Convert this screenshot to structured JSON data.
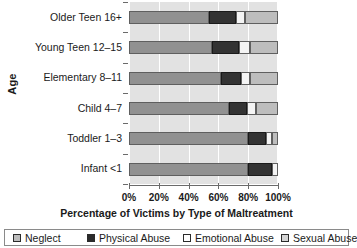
{
  "chart_data": {
    "type": "bar",
    "orientation": "horizontal",
    "stacked": true,
    "normalized": "100%",
    "title": "",
    "xlabel": "Percentage of Victims by Type of Maltreatment",
    "ylabel": "Age",
    "xlim": [
      0,
      100
    ],
    "xticks": [
      "0%",
      "20%",
      "40%",
      "60%",
      "80%",
      "100%"
    ],
    "xtick_values": [
      0,
      20,
      40,
      60,
      80,
      100
    ],
    "grid": "vertical",
    "legend_position": "bottom",
    "categories": [
      "Infant <1",
      "Toddler 1–3",
      "Child 4–7",
      "Elementary 8–11",
      "Young Teen 12–15",
      "Older Teen 16+"
    ],
    "categories_top_to_bottom": [
      "Older Teen 16+",
      "Young Teen 12–15",
      "Elementary 8–11",
      "Child 4–7",
      "Toddler 1–3",
      "Infant <1"
    ],
    "series": [
      {
        "name": "Neglect",
        "color": "#919191",
        "values": [
          80,
          80,
          67,
          62,
          56,
          54
        ]
      },
      {
        "name": "Physical Abuse",
        "color": "#333333",
        "values": [
          16,
          12,
          12,
          13,
          18,
          18
        ]
      },
      {
        "name": "Emotional Abuse",
        "color": "#f4f4f4",
        "values": [
          4,
          4,
          6,
          6,
          7,
          6
        ]
      },
      {
        "name": "Sexual Abuse",
        "color": "#bdbdbd",
        "values": [
          0,
          4,
          15,
          19,
          19,
          22
        ]
      }
    ]
  },
  "legend": {
    "items": [
      {
        "label": "Neglect",
        "swatch": "neglect-swatch"
      },
      {
        "label": "Physical Abuse",
        "swatch": "physical-abuse-swatch"
      },
      {
        "label": "Emotional  Abuse",
        "swatch": "emotional-abuse-swatch"
      },
      {
        "label": "Sexual Abuse",
        "swatch": "sexual-abuse-swatch"
      }
    ]
  }
}
